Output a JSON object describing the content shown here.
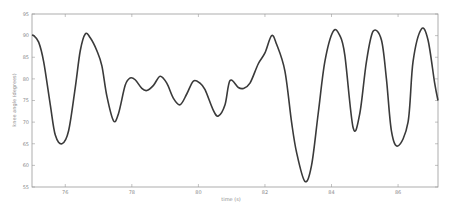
{
  "chart_data": {
    "type": "line",
    "title": "",
    "xlabel": "time (s)",
    "ylabel": "knee angle (degrees)",
    "xlim": [
      75.0,
      87.2
    ],
    "ylim": [
      55,
      95
    ],
    "xticks": [
      76,
      78,
      80,
      82,
      84,
      86
    ],
    "yticks": [
      55,
      60,
      65,
      70,
      75,
      80,
      85,
      90,
      95
    ],
    "grid": false,
    "legend": null,
    "line_color": "#3a3a3a",
    "series": [
      {
        "name": "knee angle",
        "x": [
          75.0,
          75.05,
          75.2,
          75.35,
          75.55,
          75.7,
          75.9,
          76.1,
          76.3,
          76.45,
          76.6,
          76.75,
          76.95,
          77.1,
          77.25,
          77.45,
          77.6,
          77.8,
          77.95,
          78.1,
          78.3,
          78.45,
          78.65,
          78.85,
          79.05,
          79.25,
          79.45,
          79.65,
          79.85,
          80.05,
          80.2,
          80.45,
          80.6,
          80.8,
          80.95,
          81.2,
          81.35,
          81.55,
          81.8,
          82.0,
          82.2,
          82.35,
          82.6,
          82.8,
          82.95,
          83.2,
          83.4,
          83.6,
          83.8,
          84.05,
          84.25,
          84.4,
          84.65,
          84.85,
          85.05,
          85.25,
          85.5,
          85.65,
          85.8,
          86.0,
          86.3,
          86.45,
          86.7,
          86.9,
          87.1,
          87.2
        ],
        "y": [
          90.1,
          90.0,
          88.5,
          84.0,
          74.0,
          67.0,
          65.0,
          68.0,
          78.0,
          86.5,
          90.4,
          89.5,
          86.5,
          83.0,
          76.0,
          70.3,
          72.0,
          78.5,
          80.2,
          79.8,
          77.8,
          77.3,
          78.5,
          80.6,
          79.0,
          75.5,
          74.0,
          76.5,
          79.5,
          79.0,
          77.5,
          72.7,
          71.4,
          74.0,
          79.6,
          78.0,
          77.8,
          79.0,
          83.5,
          86.0,
          90.0,
          88.0,
          81.8,
          70.0,
          63.0,
          56.3,
          60.0,
          72.0,
          84.0,
          91.0,
          90.0,
          85.5,
          68.7,
          72.0,
          84.0,
          91.0,
          89.0,
          80.0,
          68.0,
          64.5,
          70.0,
          84.0,
          91.5,
          89.0,
          79.0,
          75.0
        ]
      }
    ]
  }
}
